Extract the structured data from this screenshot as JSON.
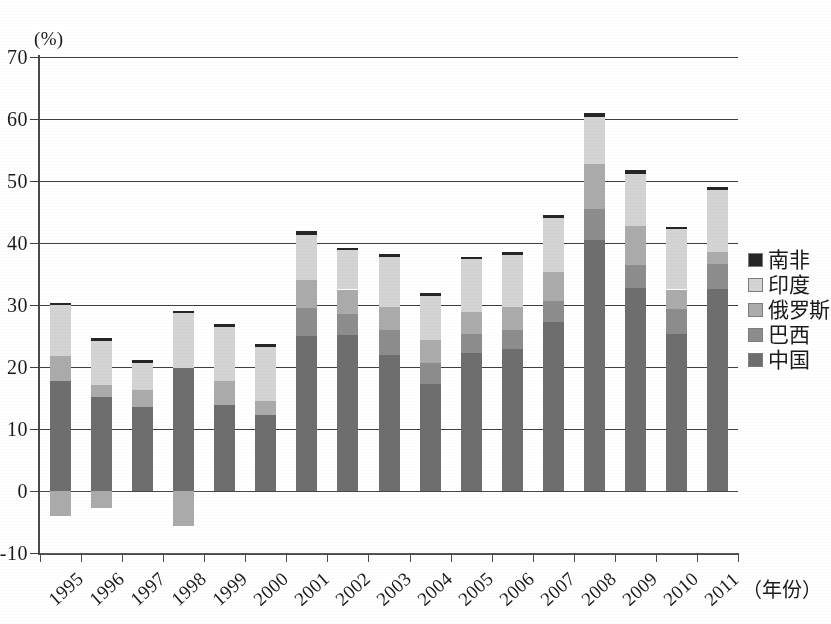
{
  "chart_data": {
    "type": "bar",
    "title": "",
    "subtitle": "",
    "xlabel": "（年份）",
    "ylabel": "(%)",
    "yunit": "(%)",
    "ylim": [
      -10,
      70
    ],
    "yticks": [
      -10,
      0,
      10,
      20,
      30,
      40,
      50,
      60,
      70
    ],
    "ytick_labels": [
      "-10",
      "0",
      "10",
      "20",
      "30",
      "40",
      "50",
      "60",
      "70"
    ],
    "grid": true,
    "grid_axis": "y",
    "stacked": true,
    "legend_position": "right",
    "categories": [
      "1995",
      "1996",
      "1997",
      "1998",
      "1999",
      "2000",
      "2001",
      "2002",
      "2003",
      "2004",
      "2005",
      "2006",
      "2007",
      "2008",
      "2009",
      "2010",
      "2011"
    ],
    "series": [
      {
        "name": "中国",
        "color": "#6e6e6e",
        "values": [
          17.7,
          15.2,
          13.6,
          19.8,
          13.8,
          12.2,
          25.0,
          25.1,
          22.0,
          17.2,
          22.3,
          22.9,
          27.2,
          40.5,
          32.8,
          25.4,
          32.6
        ]
      },
      {
        "name": "巴西",
        "color": "#8d8d8d",
        "values": [
          0.0,
          0.0,
          0.0,
          0.0,
          0.0,
          0.0,
          4.5,
          3.5,
          4.0,
          3.5,
          3.0,
          3.0,
          3.4,
          5.0,
          3.6,
          4.0,
          4.0
        ]
      },
      {
        "name": "俄罗斯",
        "color": "#ababab",
        "values": [
          4.1,
          1.9,
          2.7,
          0.0,
          4.0,
          2.3,
          4.5,
          3.9,
          3.7,
          3.7,
          3.5,
          3.8,
          4.8,
          7.3,
          6.3,
          3.1,
          2.0
        ]
      },
      {
        "name": "印度",
        "color": "#d4d4d4",
        "values": [
          8.2,
          7.1,
          4.4,
          8.9,
          8.7,
          8.7,
          7.3,
          6.3,
          8.1,
          7.0,
          8.6,
          8.4,
          8.6,
          7.5,
          8.4,
          9.7,
          10.0
        ]
      },
      {
        "name": "南非",
        "color": "#262626",
        "values": [
          0.4,
          0.4,
          0.4,
          0.3,
          0.4,
          0.5,
          0.7,
          0.4,
          0.5,
          0.5,
          0.4,
          0.4,
          0.5,
          0.7,
          0.6,
          0.4,
          0.4
        ]
      }
    ],
    "negative_series": [
      {
        "name": "俄罗斯",
        "color": "#ababab",
        "values": [
          -4.0,
          -2.8,
          0.0,
          -5.7,
          0.0,
          0.0,
          0.0,
          0.0,
          0.0,
          0.0,
          0.0,
          0.0,
          0.0,
          0.0,
          0.0,
          0.0,
          0.0
        ]
      }
    ],
    "totals": [
      30.4,
      24.6,
      21.1,
      29.0,
      26.9,
      23.7,
      42.0,
      39.2,
      38.3,
      31.9,
      37.8,
      38.5,
      44.5,
      61.0,
      51.7,
      42.6,
      49.0
    ]
  },
  "legend": {
    "items": [
      {
        "label": "南非",
        "color": "#262626"
      },
      {
        "label": "印度",
        "color": "#d4d4d4"
      },
      {
        "label": "俄罗斯",
        "color": "#ababab"
      },
      {
        "label": "巴西",
        "color": "#8d8d8d"
      },
      {
        "label": "中国",
        "color": "#6e6e6e"
      }
    ]
  },
  "axes": {
    "y_unit_label": "(%)",
    "x_axis_label": "（年份）"
  }
}
